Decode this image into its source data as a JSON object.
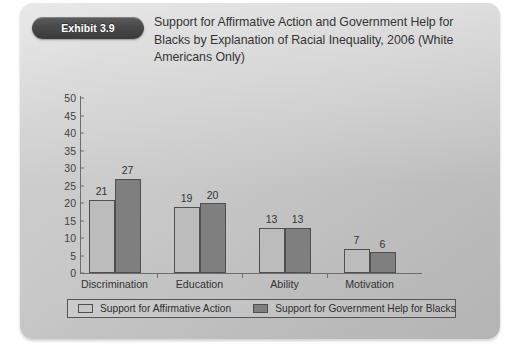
{
  "exhibit": {
    "badge_label": "Exhibit 3.9",
    "title": "Support for Affirmative Action and Government Help for Blacks by Explanation of Racial Inequality, 2006 (White Americans Only)"
  },
  "colors": {
    "series_0": "#bcbcbc",
    "series_1": "#7f7f7f",
    "bar_outline": "#4f4f4f",
    "axis": "#6d6d6d",
    "badge_bg": "#4a4a4a",
    "panel_bg": "#c8c8c8",
    "text": "#333333"
  },
  "chart_data": {
    "type": "bar",
    "title": "Support for Affirmative Action and Government Help for Blacks by Explanation of Racial Inequality, 2006 (White Americans Only)",
    "xlabel": "",
    "ylabel": "",
    "ylim": [
      0,
      50
    ],
    "ytick_step": 5,
    "yticks": [
      0,
      5,
      10,
      15,
      20,
      25,
      30,
      35,
      40,
      45,
      50
    ],
    "ytick_labels": [
      "0",
      "5",
      "10",
      "15",
      "20",
      "25",
      "30",
      "35",
      "40",
      "45",
      "50"
    ],
    "grid": false,
    "legend_position": "bottom",
    "categories": [
      "Discrimination",
      "Education",
      "Ability",
      "Motivation"
    ],
    "series": [
      {
        "name": "Support for Affirmative Action",
        "values": [
          21,
          19,
          13,
          7
        ],
        "labels": [
          "21",
          "19",
          "13",
          "7"
        ],
        "color": "#bcbcbc"
      },
      {
        "name": "Support for Government Help for Blacks",
        "values": [
          27,
          20,
          13,
          6
        ],
        "labels": [
          "27",
          "20",
          "13",
          "6"
        ],
        "color": "#7f7f7f"
      }
    ]
  }
}
